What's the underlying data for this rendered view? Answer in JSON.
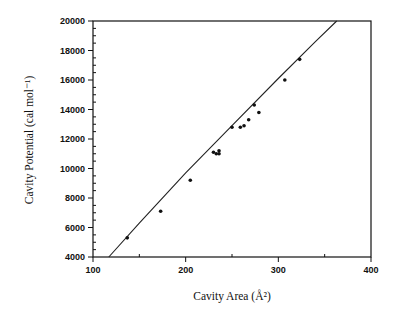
{
  "chart_data": {
    "type": "scatter",
    "title": "",
    "xlabel": "Cavity Area (Å²)",
    "ylabel": "Cavity Potential (cal mol⁻¹)",
    "xlim": [
      100,
      400
    ],
    "ylim": [
      4000,
      20000
    ],
    "x_ticks": [
      100,
      200,
      300,
      400
    ],
    "x_minor_ticks": [
      150,
      250,
      350
    ],
    "y_ticks": [
      4000,
      6000,
      8000,
      10000,
      12000,
      14000,
      16000,
      18000,
      20000
    ],
    "grid": false,
    "legend": null,
    "series": [
      {
        "name": "data",
        "kind": "points",
        "x": [
          137,
          173,
          205,
          230,
          233,
          236,
          236,
          250,
          259,
          263,
          268,
          274,
          279,
          307,
          323
        ],
        "y": [
          5300,
          7100,
          9200,
          11100,
          11000,
          11000,
          11200,
          12800,
          12800,
          12900,
          13300,
          14300,
          13800,
          16000,
          17400
        ]
      },
      {
        "name": "fit",
        "kind": "line",
        "x": [
          117,
          150,
          200,
          250,
          300,
          340,
          363
        ],
        "y": [
          4000,
          6300,
          9700,
          12900,
          16100,
          18600,
          20000
        ]
      }
    ]
  }
}
